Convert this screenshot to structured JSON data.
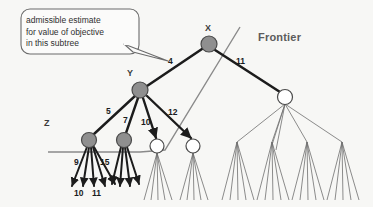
{
  "diagram": {
    "type": "search-tree-frontier",
    "background_color": "#f7f7f5",
    "callout": {
      "text": "admissible estimate\nfor value of objective\nin this subtree",
      "border_color": "#6b6b6b",
      "fill_color": "#fbfbfa",
      "pointer_target": "edge-label-4"
    },
    "labels": {
      "frontier": "Frontier",
      "node_x": "X",
      "node_y": "Y",
      "node_z": "Z"
    },
    "edge_labels": {
      "x_to_y": "4",
      "x_to_right": "11",
      "y_to_z": "5",
      "y_child2": "7",
      "y_child3": "10",
      "y_child4": "12",
      "z_child_a": "9",
      "z_child_b": "15",
      "leaf_a": "10",
      "leaf_b": "11"
    },
    "colors": {
      "expanded_node_fill": "#8f8f8f",
      "expanded_node_stroke": "#4a4a4a",
      "frontier_node_fill": "#ffffff",
      "frontier_node_stroke": "#4a4a4a",
      "thick_edge": "#1c1c1c",
      "thin_edge": "#6e6e6e",
      "frontier_line": "#8a8a8a",
      "label_gray": "#5c5c5c"
    },
    "nodes": [
      {
        "id": "X",
        "x": 209,
        "y": 44,
        "r": 8,
        "state": "expanded"
      },
      {
        "id": "Y",
        "x": 140,
        "y": 90,
        "r": 8,
        "state": "expanded"
      },
      {
        "id": "Z",
        "x": 89,
        "y": 140,
        "r": 7.5,
        "state": "expanded"
      },
      {
        "id": "W",
        "x": 124,
        "y": 140,
        "r": 7.5,
        "state": "expanded"
      },
      {
        "id": "F1",
        "x": 157,
        "y": 146,
        "r": 7,
        "state": "frontier"
      },
      {
        "id": "F2",
        "x": 193,
        "y": 146,
        "r": 7,
        "state": "frontier"
      },
      {
        "id": "R",
        "x": 285,
        "y": 97,
        "r": 7.5,
        "state": "frontier"
      }
    ]
  }
}
